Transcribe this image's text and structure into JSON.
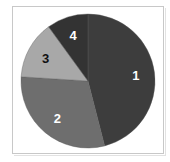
{
  "chart_data": {
    "type": "pie",
    "title": "",
    "categories": [
      "1",
      "2",
      "3",
      "4"
    ],
    "values": [
      46,
      30,
      14,
      10
    ],
    "colors": [
      "#3d3d3d",
      "#6e6e6e",
      "#a8a8a8",
      "#333333"
    ],
    "label_colors": [
      "#ffffff",
      "#ffffff",
      "#111111",
      "#ffffff"
    ],
    "start_angle_deg": 0,
    "direction": "clockwise",
    "legend": "none",
    "labels_on_slices": true
  }
}
